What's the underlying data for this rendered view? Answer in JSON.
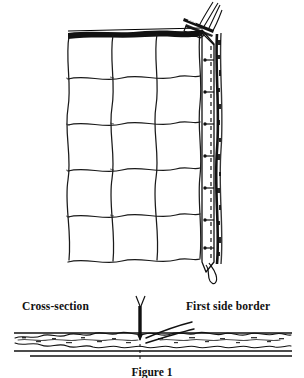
{
  "figure": {
    "caption": "Figure 1",
    "labels": {
      "cross_section": "Cross-section",
      "first_side_border": "First side border"
    },
    "colors": {
      "ink": "#000000",
      "background": "#ffffff",
      "label_text": "#111111"
    },
    "panel": {
      "name": "quilted grid panel",
      "columns": 3,
      "rows": 5,
      "left": 68,
      "right": 200,
      "top": 32,
      "bottom": 262
    },
    "side_border": {
      "name": "first side border strip",
      "stitch_marks": 7,
      "dashed_guide": true,
      "thread_loop": true
    },
    "needle": {
      "name": "needle and thread at top corner",
      "present": true
    },
    "cross_section": {
      "arrow_direction": "down",
      "fabric_band_top": 333,
      "fabric_band_bottom": 349
    }
  }
}
